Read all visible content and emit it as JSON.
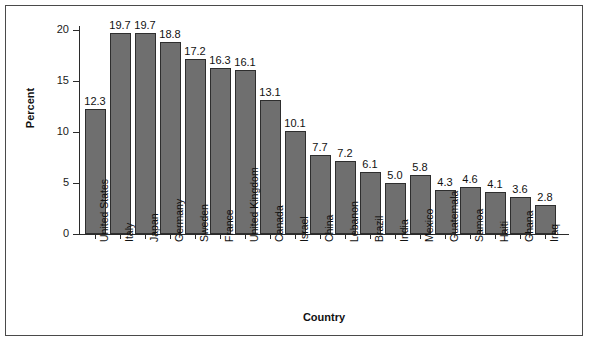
{
  "chart_data": {
    "type": "bar",
    "title": "",
    "xlabel": "Country",
    "ylabel": "Percent",
    "ylim": [
      0,
      20
    ],
    "yticks": [
      0,
      5,
      10,
      15,
      20
    ],
    "grid": false,
    "legend": null,
    "orientation": "vertical",
    "bar_color": "#6f6f6f",
    "bar_edge_color": "#2e2e2e",
    "value_labels_shown": true,
    "categories": [
      "United States",
      "Italy",
      "Japan",
      "Germany",
      "Sweden",
      "France",
      "United Kingdom",
      "Canada",
      "Israel",
      "China",
      "Lebanon",
      "Brazil",
      "India",
      "Mexico",
      "Guatemala",
      "Samoa",
      "Haiti",
      "Ghana",
      "Iraq"
    ],
    "values": [
      12.3,
      19.7,
      19.7,
      18.8,
      17.2,
      16.3,
      16.1,
      13.1,
      10.1,
      7.7,
      7.2,
      6.1,
      5.0,
      5.8,
      4.3,
      4.6,
      4.1,
      3.6,
      2.8
    ],
    "value_labels": [
      "12.3",
      "19.7",
      "19.7",
      "18.8",
      "17.2",
      "16.3",
      "16.1",
      "13.1",
      "10.1",
      "7.7",
      "7.2",
      "6.1",
      "5.0",
      "5.8",
      "4.3",
      "4.6",
      "4.1",
      "3.6",
      "2.8"
    ],
    "ytick_labels": [
      "0",
      "5",
      "10",
      "15",
      "20"
    ]
  }
}
